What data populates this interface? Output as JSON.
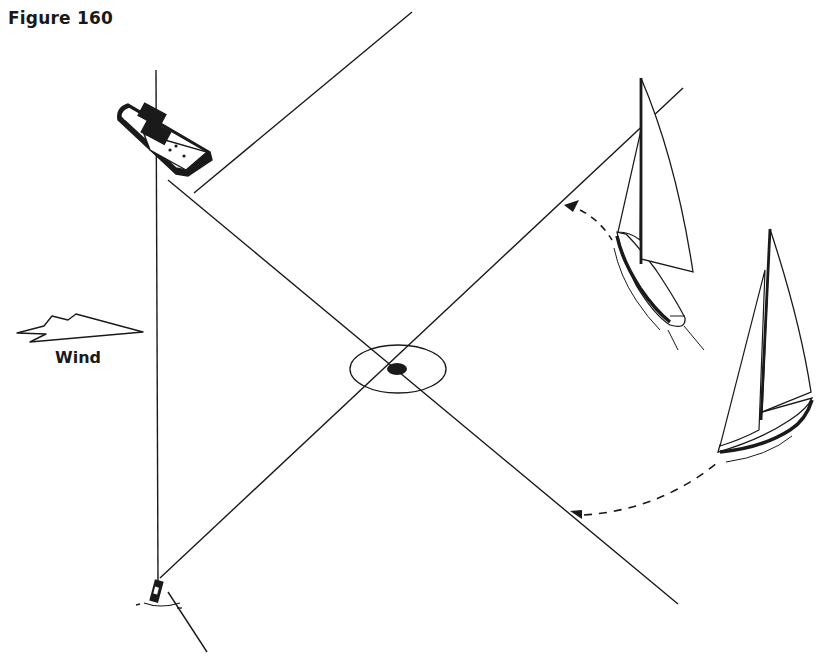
{
  "figure": {
    "title": "Figure 160",
    "wind_label": "Wind"
  },
  "colors": {
    "ink": "#1a1a1a",
    "background": "#ffffff"
  },
  "elements": {
    "committee_boat": "motorboat-icon",
    "buoy": "buoy-icon",
    "mark": "target-mark",
    "yacht_upper": "sailboat-icon",
    "yacht_lower": "sailboat-icon",
    "wind_arrow": "wind-arrow-icon"
  }
}
